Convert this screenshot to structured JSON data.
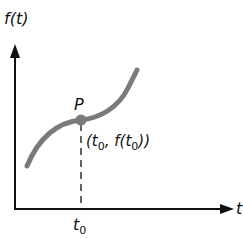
{
  "diagram": {
    "y_axis_label": "f",
    "y_axis_label_paren": "(t)",
    "x_axis_label": "t",
    "point_label": "P",
    "point_coord": {
      "open": "(t",
      "sub1": "0",
      "mid": ", f(t",
      "sub2": "0",
      "close": "))"
    },
    "tick_label": "t",
    "tick_sub": "0",
    "colors": {
      "axis": "#111111",
      "curve": "#7a7a7a",
      "point": "#7a7a7a"
    }
  }
}
